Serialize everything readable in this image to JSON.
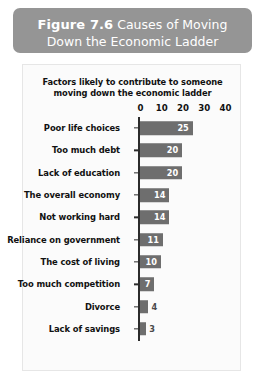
{
  "figure": {
    "number": "Figure 7.6",
    "caption_line_1": "Causes of Moving",
    "caption_line_2": "Down the Economic Ladder",
    "banner_color": "#959595"
  },
  "chart_data": {
    "type": "bar",
    "orientation": "horizontal",
    "title": "Factors likely to contribute to someone moving down the economic ladder",
    "title_line_1": "Factors likely to contribute to someone",
    "title_line_2": "moving down the economic ladder",
    "xlabel": "",
    "ylabel": "",
    "xlim": [
      0,
      40
    ],
    "grid": false,
    "legend": "none",
    "bar_color": "#6e6e6e",
    "axis_color": "#2b2b2b",
    "tick_labels": [
      "0",
      "10",
      "20",
      "30",
      "40"
    ],
    "tick_values": [
      0,
      10,
      20,
      30,
      40
    ],
    "categories": [
      "Poor life choices",
      "Too much debt",
      "Lack of education",
      "The overall economy",
      "Not working hard",
      "Reliance on government",
      "The cost of living",
      "Too much competition",
      "Divorce",
      "Lack of savings"
    ],
    "values": [
      25,
      20,
      20,
      14,
      14,
      11,
      10,
      7,
      4,
      3
    ],
    "bars": [
      {
        "label": "Poor life choices",
        "value": 25,
        "value_text": "25",
        "value_position": "inside"
      },
      {
        "label": "Too much debt",
        "value": 20,
        "value_text": "20",
        "value_position": "inside"
      },
      {
        "label": "Lack of education",
        "value": 20,
        "value_text": "20",
        "value_position": "inside"
      },
      {
        "label": "The overall economy",
        "value": 14,
        "value_text": "14",
        "value_position": "inside"
      },
      {
        "label": "Not working hard",
        "value": 14,
        "value_text": "14",
        "value_position": "inside"
      },
      {
        "label": "Reliance on government",
        "value": 11,
        "value_text": "11",
        "value_position": "inside"
      },
      {
        "label": "The cost of living",
        "value": 10,
        "value_text": "10",
        "value_position": "inside"
      },
      {
        "label": "Too much competition",
        "value": 7,
        "value_text": "7",
        "value_position": "inside"
      },
      {
        "label": "Divorce",
        "value": 4,
        "value_text": "4",
        "value_position": "outside"
      },
      {
        "label": "Lack of savings",
        "value": 3,
        "value_text": "3",
        "value_position": "outside"
      }
    ]
  }
}
